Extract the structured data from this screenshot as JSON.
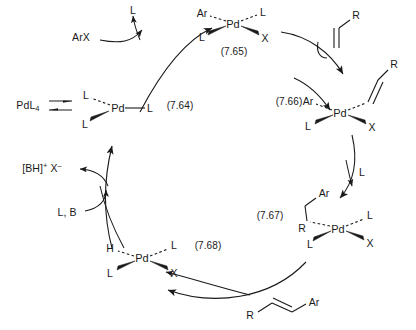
{
  "figure": {
    "type": "reaction-scheme",
    "ink_color": "#1a1a1a",
    "background": "#ffffff"
  },
  "species": {
    "precatalyst": {
      "text": "PdL",
      "subscript": "4"
    },
    "arx": "ArX",
    "ligand_out": "L",
    "ligand_in_top": "L",
    "ligand_in_mid": "L",
    "base": "L, B",
    "ammonium_salt": {
      "core": "[BH]",
      "charge": "+",
      "anion": "X",
      "anion_charge": "–"
    },
    "alkene_substrate": "R",
    "product": {
      "left": "R",
      "right": "Ar"
    }
  },
  "complexes": [
    {
      "id": "complex-764",
      "equation": "(7.64)",
      "metal": "Pd",
      "ligands": [
        {
          "label": "L",
          "position": "upper-left",
          "bond": "dashed"
        },
        {
          "label": "L",
          "position": "lower-left",
          "bond": "wedge"
        },
        {
          "label": "L",
          "position": "right",
          "bond": "plain"
        }
      ]
    },
    {
      "id": "complex-765",
      "equation": "(7.65)",
      "metal": "Pd",
      "ligands": [
        {
          "label": "Ar",
          "position": "upper-left",
          "bond": "dashed"
        },
        {
          "label": "L",
          "position": "upper-right",
          "bond": "dashed"
        },
        {
          "label": "L",
          "position": "lower-left",
          "bond": "wedge"
        },
        {
          "label": "X",
          "position": "lower-right",
          "bond": "wedge"
        }
      ]
    },
    {
      "id": "complex-766",
      "equation": "(7.66)",
      "metal": "Pd",
      "ligands": [
        {
          "label": "Ar",
          "position": "upper-left",
          "bond": "dashed"
        },
        {
          "label": "R",
          "position": "upper-right",
          "bond": "dashed-alkene"
        },
        {
          "label": "L",
          "position": "lower-left",
          "bond": "wedge"
        },
        {
          "label": "X",
          "position": "lower-right",
          "bond": "wedge"
        }
      ]
    },
    {
      "id": "complex-767",
      "equation": "(7.67)",
      "metal": "Pd",
      "ligands": [
        {
          "label": "R",
          "position": "upper-left",
          "bond": "dashed-alkyl",
          "chain_tip": "Ar"
        },
        {
          "label": "L",
          "position": "upper-right",
          "bond": "dashed"
        },
        {
          "label": "L",
          "position": "lower-left",
          "bond": "wedge"
        },
        {
          "label": "X",
          "position": "lower-right",
          "bond": "wedge"
        }
      ]
    },
    {
      "id": "complex-768",
      "equation": "(7.68)",
      "metal": "Pd",
      "ligands": [
        {
          "label": "H",
          "position": "upper-left",
          "bond": "dashed"
        },
        {
          "label": "L",
          "position": "upper-right",
          "bond": "dashed"
        },
        {
          "label": "L",
          "position": "lower-left",
          "bond": "wedge"
        },
        {
          "label": "X",
          "position": "lower-right",
          "bond": "wedge"
        }
      ]
    }
  ],
  "equation_labels": {
    "e764": "(7.64)",
    "e765": "(7.65)",
    "e766": "(7.66)",
    "e767": "(7.67)",
    "e768": "(7.68)"
  },
  "steps": [
    {
      "name": "ligand-dissociation",
      "label": "PdL4 ⇌ PdL3"
    },
    {
      "name": "oxidative-addition",
      "label": "ArX"
    },
    {
      "name": "ligand-loss",
      "label": "L"
    },
    {
      "name": "alkene-coordination",
      "label": "R"
    },
    {
      "name": "ligand-loss-2",
      "label": "L"
    },
    {
      "name": "migratory-insertion",
      "label": ""
    },
    {
      "name": "beta-hydride-elimination",
      "label": ""
    },
    {
      "name": "reductive-elimination",
      "label": "L, B"
    }
  ]
}
